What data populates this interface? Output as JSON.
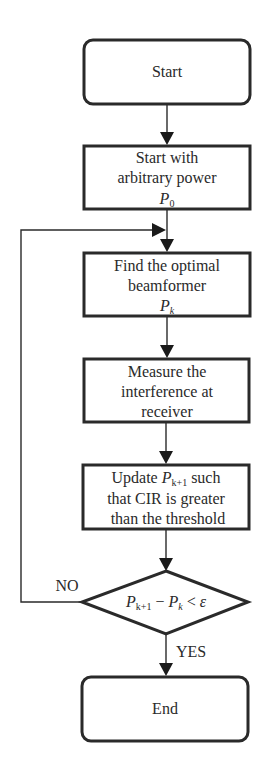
{
  "diagram": {
    "type": "flowchart",
    "nodes": {
      "start": {
        "shape": "rounded-rect",
        "label": "Start"
      },
      "init": {
        "shape": "rect",
        "lines": [
          "Start with",
          "arbitrary power"
        ],
        "symbol": "P",
        "symbol_sub": "0"
      },
      "beamformer": {
        "shape": "rect",
        "lines": [
          "Find the optimal",
          "beamformer"
        ],
        "symbol": "P",
        "symbol_sub": "k"
      },
      "measure": {
        "shape": "rect",
        "lines": [
          "Measure the",
          "interference at",
          "receiver"
        ]
      },
      "update": {
        "shape": "rect",
        "line1_pre": "Update ",
        "line1_symbol": "P",
        "line1_sub": "k+1",
        "line1_post": " such",
        "lines": [
          "that CIR is greater",
          "than the threshold"
        ]
      },
      "decision": {
        "shape": "diamond",
        "p1": "P",
        "p1_sub": "k+1",
        "minus": " − ",
        "p2": "P",
        "p2_sub": "k",
        "lt": " < ",
        "eps": "ε"
      },
      "end": {
        "shape": "rounded-rect",
        "label": "End"
      }
    },
    "edges": [
      {
        "from": "start",
        "to": "init"
      },
      {
        "from": "init",
        "to": "beamformer"
      },
      {
        "from": "beamformer",
        "to": "measure"
      },
      {
        "from": "measure",
        "to": "update"
      },
      {
        "from": "update",
        "to": "decision"
      },
      {
        "from": "decision",
        "to": "end",
        "label": "YES"
      },
      {
        "from": "decision",
        "to": "beamformer",
        "label": "NO"
      }
    ],
    "labels": {
      "yes": "YES",
      "no": "NO"
    }
  }
}
